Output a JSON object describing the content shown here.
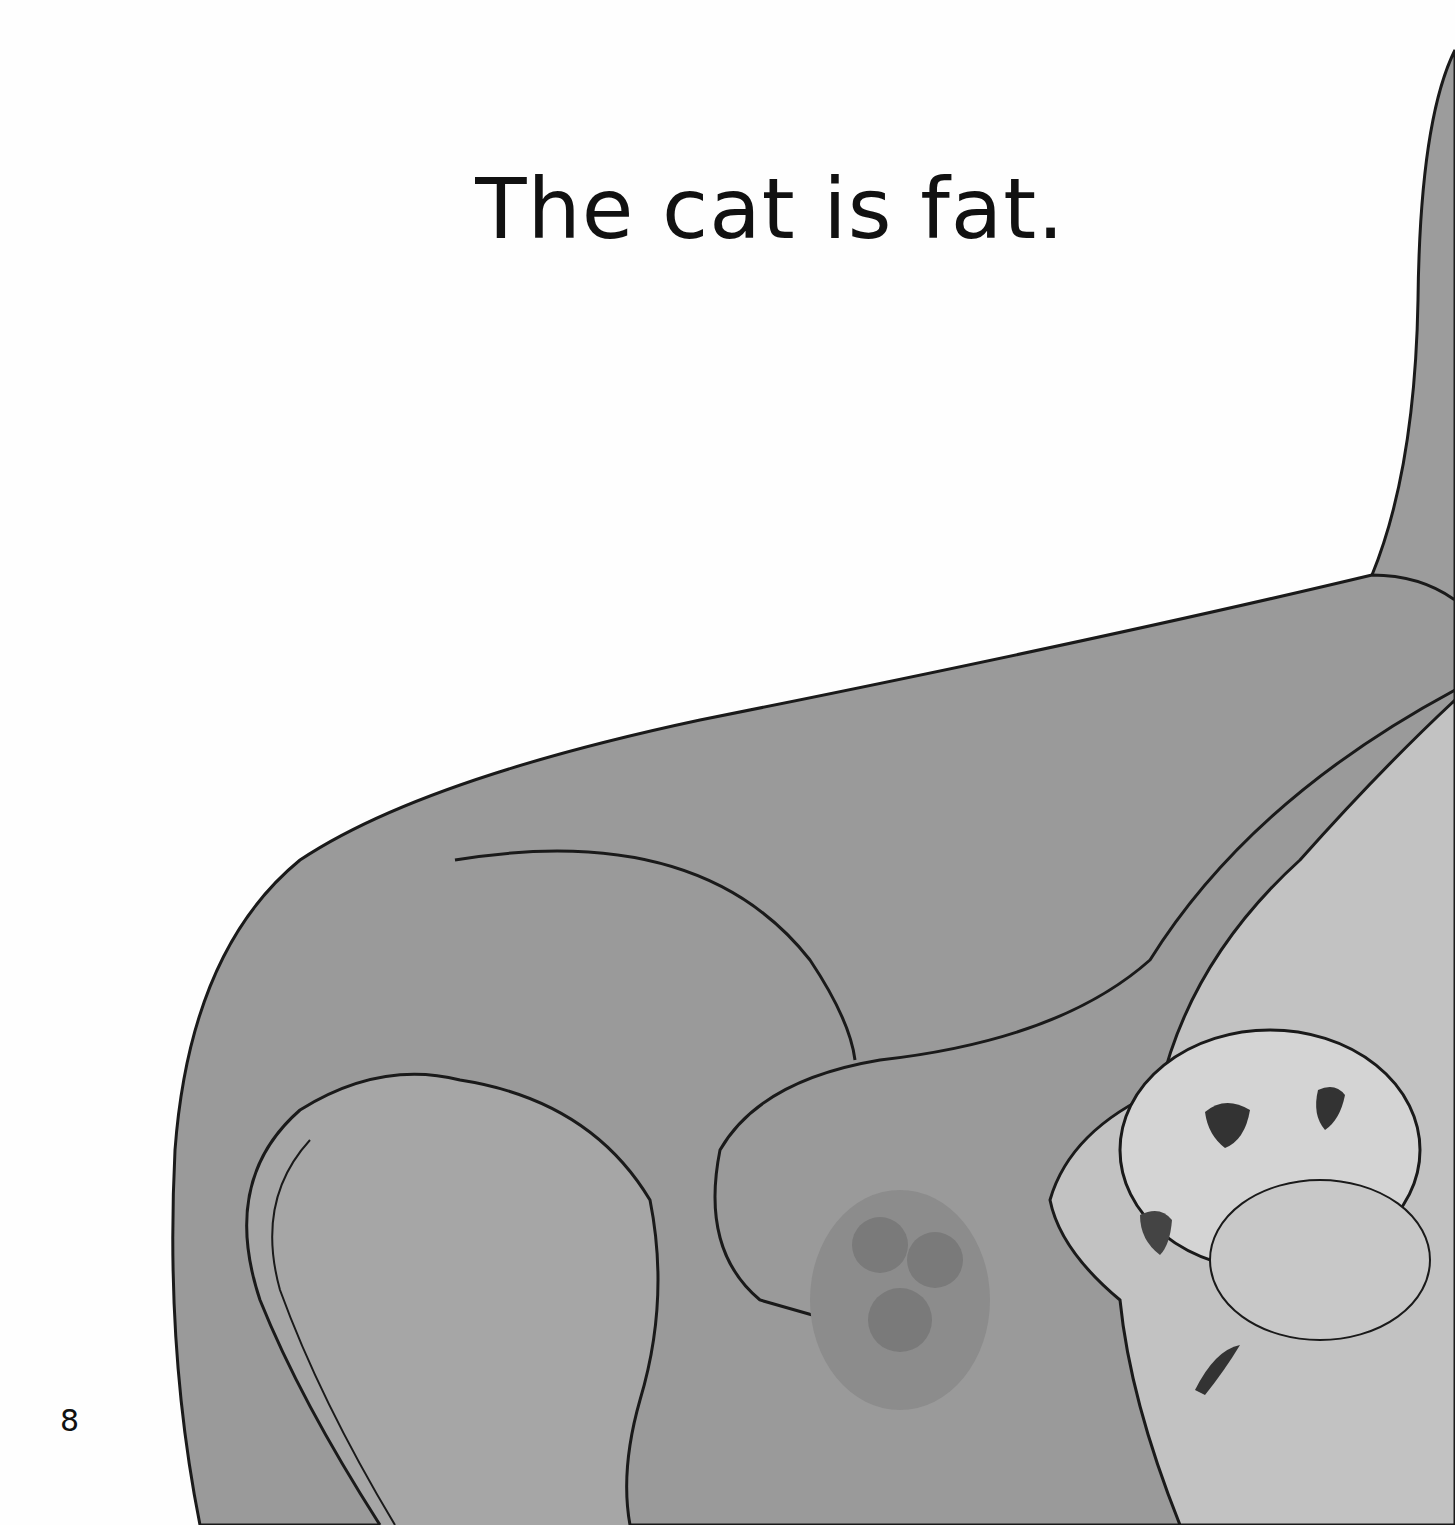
{
  "page": {
    "caption": "The cat is fat.",
    "page_number": "8"
  },
  "illustration": {
    "subject": "fluffy cat peeking from beside a sofa armrest",
    "colors": {
      "sofa": "#9a9a9a",
      "sofa_dark": "#8a8a8a",
      "cat": "#c4c4c4",
      "cat_light": "#e2e2e2",
      "outline": "#1a1a1a",
      "background": "#fefefe"
    }
  }
}
